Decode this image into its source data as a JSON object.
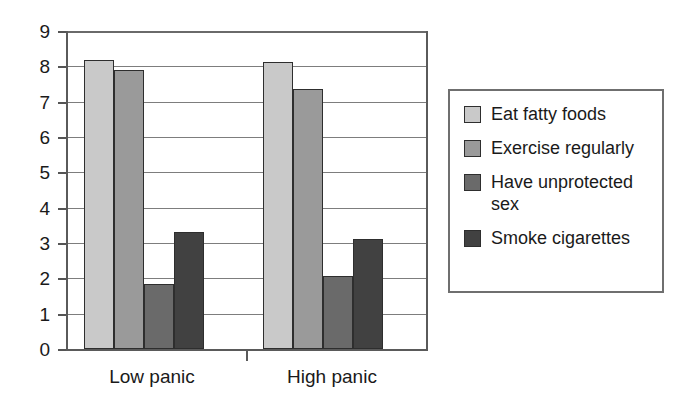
{
  "chart_data": {
    "type": "bar",
    "title": "",
    "subtitle": "",
    "xlabel": "",
    "ylabel": "",
    "categories": [
      "Low panic",
      "High panic"
    ],
    "series": [
      {
        "name": "Eat fatty foods",
        "color": "#c9c9c9",
        "values": [
          8.17,
          8.13
        ]
      },
      {
        "name": "Exercise regularly",
        "color": "#9a9a9a",
        "values": [
          7.9,
          7.37
        ]
      },
      {
        "name": "Have unprotected sex",
        "color": "#6a6a6a",
        "values": [
          1.85,
          2.07
        ]
      },
      {
        "name": "Smoke cigarettes",
        "color": "#414141",
        "values": [
          3.3,
          3.1
        ]
      }
    ],
    "ylim": [
      0,
      9
    ],
    "ytick_labels": [
      "9",
      "8",
      "7",
      "6",
      "5",
      "4",
      "3",
      "2",
      "1",
      "0"
    ],
    "ytick_values": [
      9,
      8,
      7,
      6,
      5,
      4,
      3,
      2,
      1,
      0
    ],
    "grid": true,
    "grid_axis": "y",
    "legend_position": "right",
    "legend_entries": [
      "Eat fatty foods",
      "Exercise regularly",
      "Have unprotected sex",
      "Smoke cigarettes"
    ],
    "legend_label_lines": [
      [
        "Eat fatty foods"
      ],
      [
        "Exercise regularly"
      ],
      [
        "Have unprotected",
        "sex"
      ],
      [
        "Smoke cigarettes"
      ]
    ]
  },
  "style": {
    "background": "#ffffff",
    "axis_color": "#5a5a5a",
    "grid_color": "#7d7d7d",
    "bar_border": "#2e2e2e",
    "text_color": "#1a1a1a",
    "legend_border": "#6f6f6f"
  }
}
